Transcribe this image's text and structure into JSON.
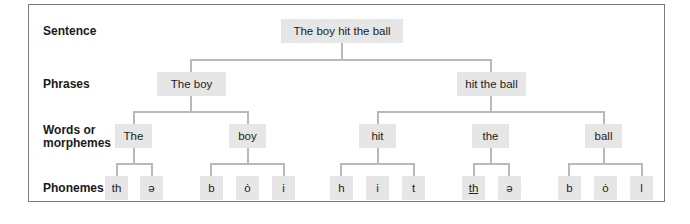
{
  "levels": {
    "sentence": "Sentence",
    "phrases": "Phrases",
    "words_line1": "Words or",
    "words_line2": "morphemes",
    "phonemes": "Phonemes"
  },
  "sentence": "The boy hit the ball",
  "phrases": [
    "The boy",
    "hit the ball"
  ],
  "words": [
    "The",
    "boy",
    "hit",
    "the",
    "ball"
  ],
  "phonemes": {
    "the_1": [
      "th",
      "ə"
    ],
    "boy": [
      "b",
      "ȯ",
      "i"
    ],
    "hit": [
      "h",
      "i",
      "t"
    ],
    "the_2": [
      "th",
      "ə"
    ],
    "ball": [
      "b",
      "ȯ",
      "l"
    ]
  },
  "colors": {
    "node_fill": "#e6e6e6",
    "connector": "#b9b9b9",
    "frame": "#7a7a7a"
  }
}
